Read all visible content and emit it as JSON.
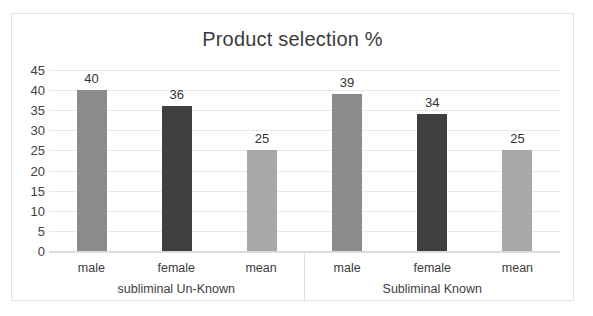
{
  "chart_data": {
    "type": "bar",
    "title": "Product selection %",
    "xlabel": "",
    "ylabel": "",
    "ylim": [
      0,
      45
    ],
    "yticks": [
      45,
      40,
      35,
      30,
      25,
      20,
      15,
      10,
      5,
      0
    ],
    "grid": true,
    "legend": "none",
    "categories": [
      "male",
      "female",
      "mean",
      "male",
      "female",
      "mean"
    ],
    "values": [
      40,
      36,
      25,
      39,
      34,
      25
    ],
    "groups": [
      {
        "label": "subliminal  Un-Known",
        "categories": [
          "male",
          "female",
          "mean"
        ],
        "values": [
          40,
          36,
          25
        ]
      },
      {
        "label": "Subliminal Known",
        "categories": [
          "male",
          "female",
          "mean"
        ],
        "values": [
          39,
          34,
          25
        ]
      }
    ],
    "bar_colors": [
      "#8c8c8c",
      "#3f3f3f",
      "#a8a8a8",
      "#8c8c8c",
      "#3f3f3f",
      "#a8a8a8"
    ],
    "data_labels": [
      "40",
      "36",
      "25",
      "39",
      "34",
      "25"
    ]
  },
  "colors": {
    "male_bar": "#8c8c8c",
    "female_bar": "#3f3f3f",
    "mean_bar": "#a8a8a8",
    "gridline": "#e9e9e9",
    "border": "#e3e3e3",
    "text": "#3b3b3b",
    "background": "#ffffff"
  }
}
